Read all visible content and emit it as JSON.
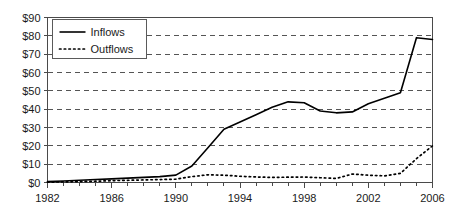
{
  "chart_data": {
    "type": "line",
    "title": "",
    "xlabel": "",
    "ylabel": "",
    "xlim": [
      1982,
      2006
    ],
    "ylim": [
      0,
      90
    ],
    "grid": true,
    "legend_position": "top-left",
    "x": [
      1982,
      1983,
      1984,
      1985,
      1986,
      1987,
      1988,
      1989,
      1990,
      1991,
      1992,
      1993,
      1994,
      1995,
      1996,
      1997,
      1998,
      1999,
      2000,
      2001,
      2002,
      2003,
      2004,
      2005,
      2006
    ],
    "ytick_labels": [
      "$0",
      "$10",
      "$20",
      "$30",
      "$40",
      "$50",
      "$60",
      "$70",
      "$80",
      "$90"
    ],
    "ytick_values": [
      0,
      10,
      20,
      30,
      40,
      50,
      60,
      70,
      80,
      90
    ],
    "xtick_labels": [
      "1982",
      "1986",
      "1990",
      "1994",
      "1998",
      "2002",
      "2006"
    ],
    "xtick_values": [
      1982,
      1986,
      1990,
      1994,
      1998,
      2002,
      2006
    ],
    "series": [
      {
        "name": "Inflows",
        "style": "solid",
        "color": "#000000",
        "values": [
          0.5,
          0.8,
          1.2,
          1.6,
          2.0,
          2.4,
          2.8,
          3.2,
          4.0,
          9.0,
          19.0,
          29.0,
          33.0,
          37.0,
          41.0,
          44.0,
          43.5,
          39.0,
          38.0,
          38.5,
          43.0,
          46.0,
          49.0,
          79.0,
          78.0
        ]
      },
      {
        "name": "Outflows",
        "style": "dotted",
        "color": "#000000",
        "values": [
          0.2,
          0.3,
          0.5,
          0.7,
          1.0,
          1.2,
          1.4,
          1.6,
          1.8,
          3.2,
          4.2,
          4.0,
          3.4,
          3.0,
          2.8,
          2.9,
          3.0,
          2.6,
          2.2,
          4.6,
          4.0,
          3.6,
          5.0,
          13.0,
          20.0
        ]
      }
    ]
  },
  "legend": {
    "entries": [
      {
        "label": "Inflows",
        "style": "solid"
      },
      {
        "label": "Outflows",
        "style": "dotted"
      }
    ]
  }
}
